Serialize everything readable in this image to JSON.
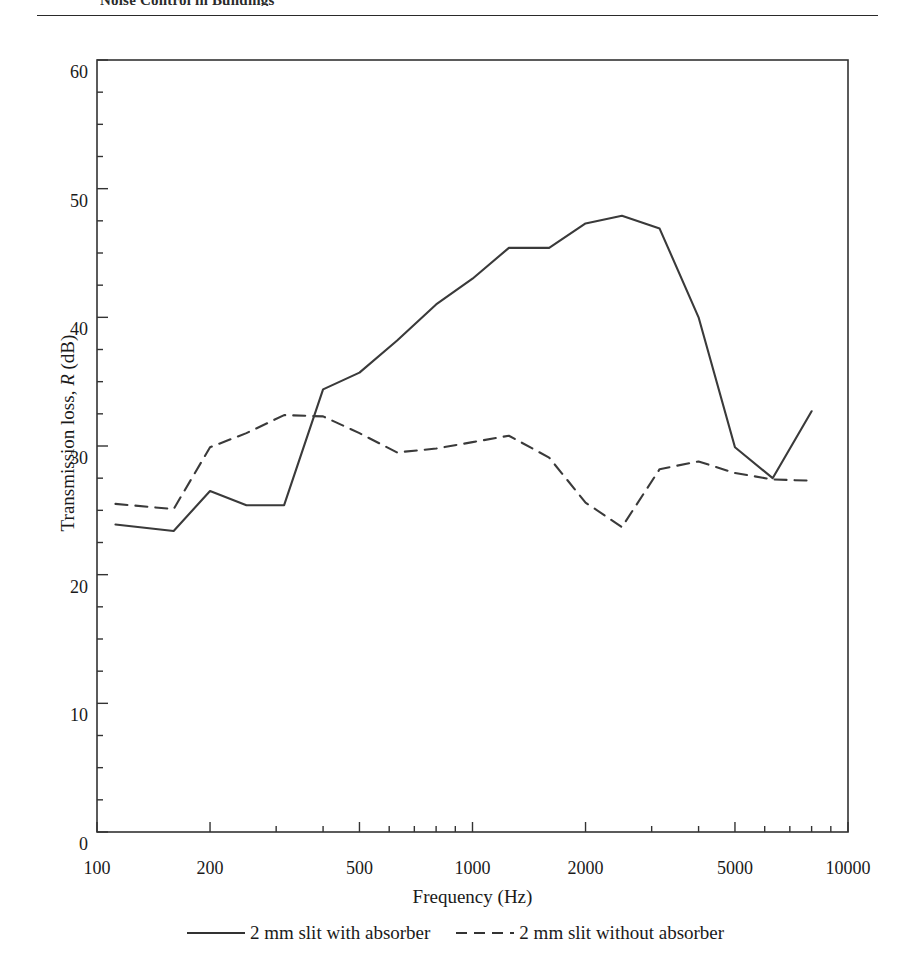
{
  "header": {
    "text": "Noise Control in Buildings"
  },
  "figure": {
    "axis_label_y_prefix": "Transmission loss, ",
    "axis_label_y_italic": "R",
    "axis_label_y_suffix": " (dB)",
    "axis_label_x": "Frequency (Hz)"
  },
  "legend": {
    "entries": [
      {
        "label": "2 mm slit with absorber",
        "style": "solid",
        "swatch": "line-solid-icon"
      },
      {
        "label": "2 mm slit without absorber",
        "style": "dashed",
        "swatch": "line-dashed-icon"
      }
    ]
  },
  "chart_data": {
    "type": "line",
    "title": "",
    "xlabel": "Frequency (Hz)",
    "ylabel": "Transmission loss, R (dB)",
    "xscale": "log",
    "xlim": [
      100,
      10000
    ],
    "ylim": [
      0,
      60
    ],
    "yticks": [
      0,
      10,
      20,
      30,
      40,
      50,
      60
    ],
    "xticks": [
      100,
      200,
      500,
      1000,
      2000,
      5000,
      10000
    ],
    "xtick_labels": [
      "100",
      "200",
      "500",
      "1000",
      "2000",
      "5000",
      "10000"
    ],
    "ytick_labels": [
      "0",
      "10",
      "20",
      "30",
      "40",
      "50",
      "60"
    ],
    "grid": false,
    "legend_position": "below",
    "series": [
      {
        "name": "2 mm slit with absorber",
        "style": "solid",
        "x": [
          112,
          160,
          200,
          250,
          315,
          400,
          500,
          630,
          800,
          1000,
          1250,
          1600,
          2000,
          2500,
          3150,
          4000,
          5000,
          6300,
          8000
        ],
        "y": [
          23.9,
          23.4,
          26.5,
          25.4,
          25.4,
          34.4,
          35.7,
          38.2,
          41.0,
          43.0,
          45.4,
          45.4,
          47.3,
          47.9,
          46.9,
          40.0,
          29.9,
          27.5,
          32.7
        ]
      },
      {
        "name": "2 mm slit without absorber",
        "style": "dashed",
        "x": [
          112,
          160,
          200,
          250,
          315,
          400,
          500,
          630,
          800,
          1000,
          1250,
          1600,
          2000,
          2500,
          3150,
          4000,
          5000,
          6300,
          8000
        ],
        "y": [
          25.5,
          25.1,
          29.9,
          31.0,
          32.4,
          32.3,
          31.0,
          29.5,
          29.8,
          30.3,
          30.8,
          29.1,
          25.6,
          23.7,
          28.2,
          28.8,
          27.9,
          27.4,
          27.3
        ]
      }
    ]
  }
}
